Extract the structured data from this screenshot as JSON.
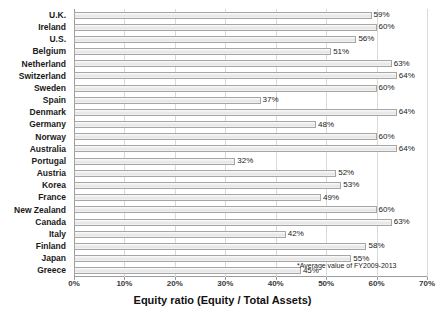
{
  "chart_data": {
    "type": "bar",
    "orientation": "horizontal",
    "title": "",
    "xlabel": "Equity ratio (Equity / Total Assets)",
    "ylabel": "",
    "xlim": [
      0,
      70
    ],
    "xticks": [
      "0%",
      "10%",
      "20%",
      "30%",
      "40%",
      "50%",
      "60%",
      "70%"
    ],
    "xtick_values": [
      0,
      10,
      20,
      30,
      40,
      50,
      60,
      70
    ],
    "grid": true,
    "legend": "none",
    "value_suffix": "%",
    "categories": [
      "U.K.",
      "Ireland",
      "U.S.",
      "Belgium",
      "Netherland",
      "Switzerland",
      "Sweden",
      "Spain",
      "Denmark",
      "Germany",
      "Norway",
      "Australia",
      "Portugal",
      "Austria",
      "Korea",
      "France",
      "New Zealand",
      "Canada",
      "Italy",
      "Finland",
      "Japan",
      "Greece"
    ],
    "values": [
      59,
      60,
      56,
      51,
      63,
      64,
      60,
      37,
      64,
      48,
      60,
      64,
      32,
      52,
      53,
      49,
      60,
      63,
      42,
      58,
      55,
      45
    ],
    "labels": [
      "59%",
      "60%",
      "56%",
      "51%",
      "63%",
      "64%",
      "60%",
      "37%",
      "64%",
      "48%",
      "60%",
      "64%",
      "32%",
      "52%",
      "53%",
      "49%",
      "60%",
      "63%",
      "42%",
      "58%",
      "55%",
      "45%"
    ],
    "annotations": [
      {
        "text": "*Average value of FY2009-2013"
      }
    ],
    "colors": {
      "bar_fill": "#ededed",
      "bar_border": "#a6a6a6",
      "gridline": "#d9d9d9",
      "axis_line": "#9c9c9c",
      "text": "#1a1a1a",
      "background": "#ffffff"
    }
  }
}
